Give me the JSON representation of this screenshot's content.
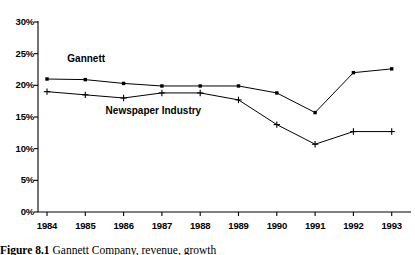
{
  "chart_data": {
    "type": "line",
    "title": "",
    "xlabel": "",
    "ylabel": "",
    "x": [
      "1984",
      "1985",
      "1986",
      "1987",
      "1988",
      "1989",
      "1990",
      "1991",
      "1992",
      "1993"
    ],
    "ylim": [
      0,
      30
    ],
    "yticks": [
      "0%",
      "5%",
      "10%",
      "15%",
      "20%",
      "25%",
      "30%"
    ],
    "ytick_values": [
      0,
      5,
      10,
      15,
      20,
      25,
      30
    ],
    "grid": false,
    "legend_position": "inline-annotation",
    "series": [
      {
        "name": "Gannett",
        "marker": "square",
        "values": [
          21.0,
          20.9,
          20.3,
          19.9,
          19.9,
          19.9,
          18.8,
          15.7,
          22.0,
          22.6
        ]
      },
      {
        "name": "Newspaper Industry",
        "marker": "plus",
        "values": [
          19.0,
          18.5,
          18.0,
          18.8,
          18.8,
          17.7,
          13.8,
          10.7,
          12.7,
          12.7
        ]
      }
    ],
    "annotations": [
      {
        "text": "Gannett",
        "x_value": "1985",
        "y_value": 24.0
      },
      {
        "text": "Newspaper Industry",
        "x_value": "1986",
        "y_value": 15.8
      }
    ]
  },
  "caption": {
    "figure_number": "Figure  8.1",
    "text": "Gannett Company, revenue, growth"
  }
}
